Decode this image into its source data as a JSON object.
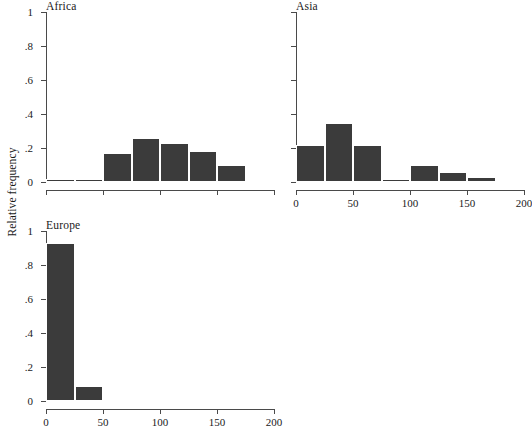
{
  "figure": {
    "ylabel": "Relative frequency",
    "bar_color": "#3b3b3b",
    "axis_color": "#4a4a4a",
    "background": "#ffffff"
  },
  "chart_data": [
    {
      "type": "bar",
      "title": "Africa",
      "xlabel": "",
      "ylabel": "Relative frequency",
      "xlim": [
        0,
        200
      ],
      "ylim": [
        0,
        1
      ],
      "bin_width": 25,
      "grid": false,
      "legend": "none",
      "x_tick_values": [
        0,
        50,
        100,
        150,
        200
      ],
      "x_tick_labels": [
        "",
        "",
        "",
        "",
        ""
      ],
      "y_tick_values": [
        0,
        0.2,
        0.4,
        0.6,
        0.8,
        1
      ],
      "y_tick_labels": [
        "0",
        ".2",
        ".4",
        ".6",
        ".8",
        "1"
      ],
      "bins": [
        {
          "start": 0,
          "end": 25,
          "value": 0.02
        },
        {
          "start": 25,
          "end": 50,
          "value": 0.02
        },
        {
          "start": 50,
          "end": 75,
          "value": 0.17
        },
        {
          "start": 75,
          "end": 100,
          "value": 0.26
        },
        {
          "start": 100,
          "end": 125,
          "value": 0.23
        },
        {
          "start": 125,
          "end": 150,
          "value": 0.18
        },
        {
          "start": 150,
          "end": 175,
          "value": 0.1
        }
      ]
    },
    {
      "type": "bar",
      "title": "Asia",
      "xlabel": "",
      "ylabel": "",
      "xlim": [
        0,
        200
      ],
      "ylim": [
        0,
        1
      ],
      "bin_width": 25,
      "grid": false,
      "legend": "none",
      "x_tick_values": [
        0,
        50,
        100,
        150,
        200
      ],
      "x_tick_labels": [
        "0",
        "50",
        "100",
        "150",
        "200"
      ],
      "y_tick_values": [
        0,
        0.2,
        0.4,
        0.6,
        0.8,
        1
      ],
      "y_tick_labels": [
        "",
        "",
        "",
        "",
        "",
        ""
      ],
      "bins": [
        {
          "start": 0,
          "end": 25,
          "value": 0.22
        },
        {
          "start": 25,
          "end": 50,
          "value": 0.35
        },
        {
          "start": 50,
          "end": 75,
          "value": 0.22
        },
        {
          "start": 75,
          "end": 100,
          "value": 0.02
        },
        {
          "start": 100,
          "end": 125,
          "value": 0.1
        },
        {
          "start": 125,
          "end": 150,
          "value": 0.06
        },
        {
          "start": 150,
          "end": 175,
          "value": 0.03
        }
      ]
    },
    {
      "type": "bar",
      "title": "Europe",
      "xlabel": "",
      "ylabel": "",
      "xlim": [
        0,
        200
      ],
      "ylim": [
        0,
        1
      ],
      "bin_width": 25,
      "grid": false,
      "legend": "none",
      "x_tick_values": [
        0,
        50,
        100,
        150,
        200
      ],
      "x_tick_labels": [
        "0",
        "50",
        "100",
        "150",
        "200"
      ],
      "y_tick_values": [
        0,
        0.2,
        0.4,
        0.6,
        0.8,
        1
      ],
      "y_tick_labels": [
        "0",
        ".2",
        ".4",
        ".6",
        ".8",
        "1"
      ],
      "bins": [
        {
          "start": 0,
          "end": 25,
          "value": 0.93
        },
        {
          "start": 25,
          "end": 50,
          "value": 0.09
        }
      ]
    }
  ],
  "panels": {
    "africa": {
      "title": "Africa"
    },
    "asia": {
      "title": "Asia"
    },
    "europe": {
      "title": "Europe"
    }
  }
}
